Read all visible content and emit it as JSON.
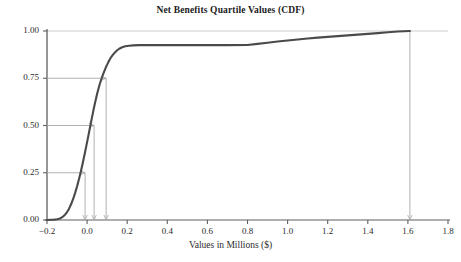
{
  "chart_data": {
    "type": "line",
    "title": "Net Benefits Quartile Values (CDF)",
    "xlabel": "Values in Millions ($)",
    "ylabel": "",
    "xlim": [
      -0.2,
      1.8
    ],
    "ylim": [
      0.0,
      1.0
    ],
    "grid": false,
    "legend": "none",
    "xticks": [
      "-0.2",
      "0.0",
      "0.2",
      "0.4",
      "0.6",
      "0.8",
      "1.0",
      "1.2",
      "1.4",
      "1.6",
      "1.8"
    ],
    "xtick_values": [
      -0.2,
      0.0,
      0.2,
      0.4,
      0.6,
      0.8,
      1.0,
      1.2,
      1.4,
      1.6,
      1.8
    ],
    "yticks": [
      "0.00",
      "0.25",
      "0.50",
      "0.75",
      "1.00"
    ],
    "ytick_values": [
      0.0,
      0.25,
      0.5,
      0.75,
      1.0
    ],
    "series": [
      {
        "name": "Net Benefits CDF",
        "color": "#4a4a4a",
        "x": [
          -0.2,
          -0.18,
          -0.165,
          -0.15,
          -0.14,
          -0.13,
          -0.12,
          -0.11,
          -0.1,
          -0.09,
          -0.08,
          -0.07,
          -0.06,
          -0.05,
          -0.04,
          -0.03,
          -0.02,
          -0.01,
          0.0,
          0.01,
          0.02,
          0.03,
          0.035,
          0.04,
          0.05,
          0.06,
          0.07,
          0.08,
          0.09,
          0.095,
          0.1,
          0.11,
          0.12,
          0.13,
          0.14,
          0.15,
          0.16,
          0.175,
          0.19,
          0.21,
          0.23,
          0.26,
          0.3,
          0.4,
          0.5,
          0.6,
          0.7,
          0.8,
          0.85,
          0.9,
          0.95,
          1.0,
          1.05,
          1.1,
          1.15,
          1.2,
          1.25,
          1.3,
          1.35,
          1.4,
          1.45,
          1.5,
          1.55,
          1.61
        ],
        "y": [
          0.0,
          0.001,
          0.002,
          0.004,
          0.007,
          0.011,
          0.018,
          0.028,
          0.042,
          0.06,
          0.083,
          0.11,
          0.142,
          0.178,
          0.218,
          0.262,
          0.31,
          0.36,
          0.412,
          0.466,
          0.52,
          0.572,
          0.598,
          0.622,
          0.668,
          0.708,
          0.742,
          0.772,
          0.798,
          0.812,
          0.822,
          0.844,
          0.862,
          0.876,
          0.888,
          0.898,
          0.906,
          0.914,
          0.919,
          0.922,
          0.924,
          0.925,
          0.925,
          0.925,
          0.925,
          0.925,
          0.925,
          0.926,
          0.932,
          0.938,
          0.944,
          0.95,
          0.955,
          0.96,
          0.965,
          0.969,
          0.973,
          0.977,
          0.981,
          0.985,
          0.989,
          0.993,
          0.997,
          1.0
        ]
      }
    ],
    "annotations": [
      {
        "name": "q1-indicator",
        "label": "0.25",
        "quantile": 0.25,
        "x_value": -0.01,
        "y_value": 0.25
      },
      {
        "name": "q2-indicator",
        "label": "0.50",
        "quantile": 0.5,
        "x_value": 0.035,
        "y_value": 0.5
      },
      {
        "name": "q3-indicator",
        "label": "0.75",
        "quantile": 0.75,
        "x_value": 0.095,
        "y_value": 0.75
      },
      {
        "name": "max-indicator",
        "label": "1.00",
        "quantile": 1.0,
        "x_value": 1.61,
        "y_value": 1.0
      }
    ],
    "colors": {
      "curve": "#4a4a4a",
      "axis": "#6e6e6e",
      "guide": "#a9a9a9",
      "text": "#2b2b2b",
      "background": "#ffffff"
    }
  }
}
